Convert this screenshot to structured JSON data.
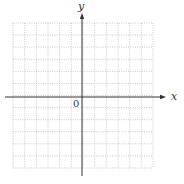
{
  "chart_data": {
    "type": "scatter",
    "title": "",
    "xlabel": "x",
    "ylabel": "y",
    "origin_label": "0",
    "grid": true,
    "grid_style": "dotted",
    "grid_cells_x": 12,
    "grid_cells_y": 12,
    "xlim": [
      -7,
      6
    ],
    "ylim": [
      -6,
      6
    ],
    "series": []
  },
  "colors": {
    "axis": "#333333",
    "grid": "#bbbbbb",
    "background": "#ffffff"
  },
  "geometry": {
    "grid_left": 13,
    "grid_top": 23,
    "grid_right": 153,
    "grid_bottom": 168,
    "origin_x": 82,
    "origin_y": 97,
    "y_axis_top": 13,
    "y_axis_bottom": 176,
    "x_axis_left": 5,
    "x_axis_right": 166
  }
}
